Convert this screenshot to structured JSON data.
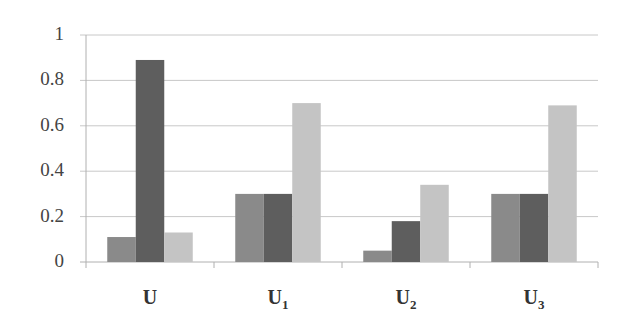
{
  "chart_data": {
    "type": "bar",
    "title": "",
    "xlabel": "",
    "ylabel": "",
    "ylim": [
      0,
      1
    ],
    "yticks": [
      "0",
      "0.2",
      "0.4",
      "0.6",
      "0.8",
      "1"
    ],
    "grid": true,
    "legend": null,
    "categories": [
      {
        "base": "U",
        "sub": ""
      },
      {
        "base": "U",
        "sub": "1"
      },
      {
        "base": "U",
        "sub": "2"
      },
      {
        "base": "U",
        "sub": "3"
      }
    ],
    "series": [
      {
        "name": "series-1",
        "color": "#8a8a8a",
        "values": [
          0.11,
          0.3,
          0.05,
          0.3
        ]
      },
      {
        "name": "series-2",
        "color": "#5e5e5e",
        "values": [
          0.89,
          0.3,
          0.18,
          0.3
        ]
      },
      {
        "name": "series-3",
        "color": "#c4c4c4",
        "values": [
          0.13,
          0.7,
          0.34,
          0.69
        ]
      }
    ]
  },
  "colors": {
    "gridline": "#c8c8c8",
    "axis": "#b0b0b0",
    "tick_text": "#444444",
    "category_text": "#333333"
  }
}
